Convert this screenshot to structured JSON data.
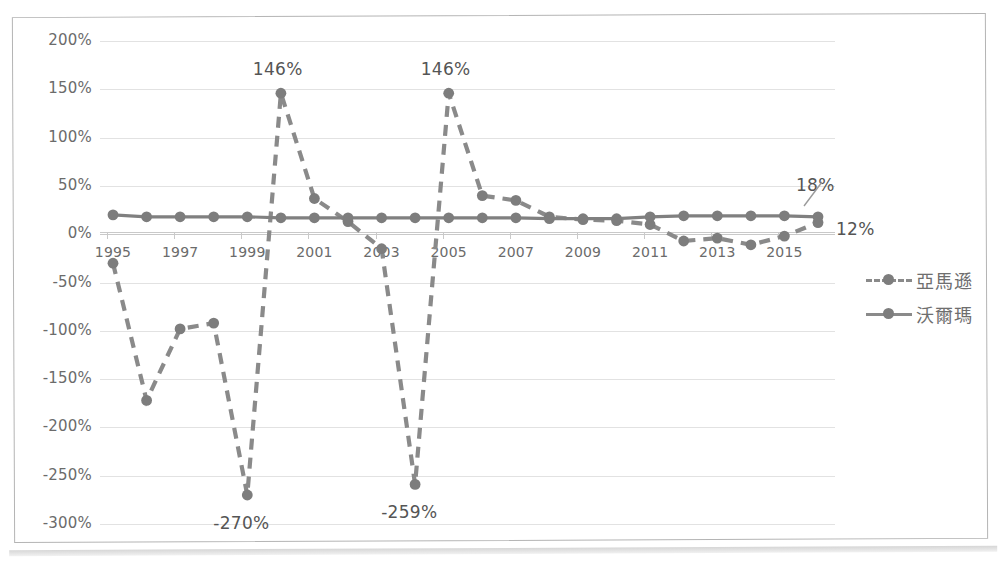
{
  "chart_data": {
    "type": "line",
    "title": "",
    "xlabel": "",
    "ylabel": "",
    "ylim": [
      -300,
      200
    ],
    "ytick_labels": [
      "200%",
      "150%",
      "100%",
      "50%",
      "0%",
      "-50%",
      "-100%",
      "-150%",
      "-200%",
      "-250%",
      "-300%"
    ],
    "ytick_values": [
      200,
      150,
      100,
      50,
      0,
      -50,
      -100,
      -150,
      -200,
      -250,
      -300
    ],
    "x": [
      1995,
      1996,
      1997,
      1998,
      1999,
      2000,
      2001,
      2002,
      2003,
      2004,
      2005,
      2006,
      2007,
      2008,
      2009,
      2010,
      2011,
      2012,
      2013,
      2014,
      2015,
      2016
    ],
    "xtick_labels": [
      "1995",
      "1997",
      "1999",
      "2001",
      "2003",
      "2005",
      "2007",
      "2009",
      "2011",
      "2013",
      "2015"
    ],
    "xtick_values": [
      1995,
      1997,
      1999,
      2001,
      2003,
      2005,
      2007,
      2009,
      2011,
      2013,
      2015
    ],
    "grid": true,
    "legend_position": "right",
    "series": [
      {
        "name": "亞馬遜",
        "style": "dashed",
        "color": "#8a8a8a",
        "values": [
          -30,
          -172,
          -98,
          -92,
          -270,
          146,
          37,
          13,
          -15,
          -259,
          146,
          40,
          35,
          18,
          15,
          14,
          10,
          -7,
          -4,
          -11,
          -2,
          12
        ]
      },
      {
        "name": "沃爾瑪",
        "style": "solid",
        "color": "#808080",
        "values": [
          20,
          18,
          18,
          18,
          18,
          17,
          17,
          17,
          17,
          17,
          17,
          17,
          17,
          16,
          16,
          16,
          18,
          19,
          19,
          19,
          19,
          18
        ]
      }
    ],
    "annotations": [
      {
        "text": "146%",
        "x": 2000,
        "y": 146,
        "position": "above"
      },
      {
        "text": "146%",
        "x": 2005,
        "y": 146,
        "position": "above"
      },
      {
        "text": "-270%",
        "x": 1999,
        "y": -270,
        "position": "below"
      },
      {
        "text": "-259%",
        "x": 2004,
        "y": -259,
        "position": "below"
      },
      {
        "text": "18%",
        "x": 2016,
        "y": 18,
        "position": "above-right"
      },
      {
        "text": "12%",
        "x": 2016,
        "y": 12,
        "position": "right"
      }
    ]
  },
  "legend": {
    "items": [
      {
        "label": "亞馬遜",
        "style": "dashed"
      },
      {
        "label": "沃爾瑪",
        "style": "solid"
      }
    ]
  },
  "colors": {
    "series": "#808080",
    "gridline": "#e2e2e2",
    "axis": "#c9c9c9",
    "text": "#6b6b6b",
    "frame": "#b4b4b4"
  }
}
